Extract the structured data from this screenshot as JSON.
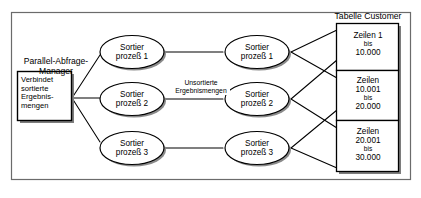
{
  "diagram": {
    "title_hidden": "",
    "frame": {
      "label": "diagram-frame"
    },
    "manager": {
      "caption_line1": "Parallel-Abfrage-",
      "caption_line2": "Manager",
      "box_line1": "Verbindet",
      "box_line2": "sortierte",
      "box_line3": "Ergebnis-",
      "box_line4": "mengen"
    },
    "left_processes": [
      {
        "line1": "Sortier",
        "line2": "prozeß 1"
      },
      {
        "line1": "Sortier",
        "line2": "prozeß 2"
      },
      {
        "line1": "Sortier",
        "line2": "prozeß 3"
      }
    ],
    "right_processes": [
      {
        "line1": "Sortier",
        "line2": "prozeß 1"
      },
      {
        "line1": "Sortier",
        "line2": "prozeß 2"
      },
      {
        "line1": "Sortier",
        "line2": "prozeß 3"
      }
    ],
    "middle_edge_label": {
      "line1": "Unsortierte",
      "line2": "Ergebnismengen"
    },
    "table": {
      "caption": "Tabelle Customer",
      "rows": [
        {
          "line1": "Zeilen 1",
          "line2": "bis",
          "line3": "10.000"
        },
        {
          "line1": "Zeilen",
          "line2": "10.001",
          "line3": "bis",
          "line4": "20.000"
        },
        {
          "line1": "Zeilen",
          "line2": "20.001",
          "line3": "bis",
          "line4": "30.000"
        }
      ]
    },
    "colors": {
      "stroke": "#000000",
      "fill": "#ffffff",
      "shadow": "#808080",
      "frame": "#555555",
      "background": "#ffffff"
    }
  }
}
